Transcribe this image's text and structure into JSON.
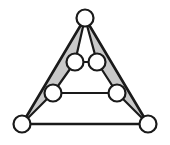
{
  "figure": {
    "type": "diagram",
    "background_color": "#ffffff",
    "width": 170,
    "height": 145
  },
  "style": {
    "edge_color": "#1a1a1a",
    "edge_width": 2.2,
    "outer_edge_width": 2.6,
    "node_fill": "#ffffff",
    "node_stroke": "#1a1a1a",
    "node_stroke_width": 2.2,
    "shade_fill": "#c9c9c9",
    "shade_stroke": "#1a1a1a"
  },
  "nodes": [
    {
      "id": "apex",
      "label": "",
      "cx": 85,
      "cy": 18,
      "r": 8.5
    },
    {
      "id": "upper-left",
      "label": "",
      "cx": 75,
      "cy": 62,
      "r": 8.5
    },
    {
      "id": "upper-right",
      "label": "",
      "cx": 97,
      "cy": 62,
      "r": 8.5
    },
    {
      "id": "mid-left",
      "label": "",
      "cx": 53,
      "cy": 93,
      "r": 8.5
    },
    {
      "id": "mid-right",
      "label": "",
      "cx": 117,
      "cy": 93,
      "r": 8.5
    },
    {
      "id": "bottom-left",
      "label": "",
      "cx": 22,
      "cy": 124,
      "r": 8.5
    },
    {
      "id": "bottom-right",
      "label": "",
      "cx": 148,
      "cy": 124,
      "r": 8.5
    }
  ],
  "edges": [
    {
      "id": "apex-to-bottom-left",
      "from": "apex",
      "to": "bottom-left",
      "kind": "outer"
    },
    {
      "id": "apex-to-bottom-right",
      "from": "apex",
      "to": "bottom-right",
      "kind": "outer"
    },
    {
      "id": "bottom-left-to-bottom-right",
      "from": "bottom-left",
      "to": "bottom-right",
      "kind": "outer"
    },
    {
      "id": "apex-to-upper-left",
      "from": "apex",
      "to": "upper-left",
      "kind": "inner"
    },
    {
      "id": "apex-to-upper-right",
      "from": "apex",
      "to": "upper-right",
      "kind": "inner"
    },
    {
      "id": "upper-left-to-upper-right",
      "from": "upper-left",
      "to": "upper-right",
      "kind": "inner"
    },
    {
      "id": "upper-left-to-mid-left",
      "from": "upper-left",
      "to": "mid-left",
      "kind": "inner"
    },
    {
      "id": "upper-right-to-mid-right",
      "from": "upper-right",
      "to": "mid-right",
      "kind": "inner"
    },
    {
      "id": "mid-left-to-mid-right",
      "from": "mid-left",
      "to": "mid-right",
      "kind": "inner"
    },
    {
      "id": "mid-left-to-bottom-left",
      "from": "mid-left",
      "to": "bottom-left",
      "kind": "inner"
    },
    {
      "id": "mid-right-to-bottom-right",
      "from": "mid-right",
      "to": "bottom-right",
      "kind": "inner"
    }
  ],
  "shaded_regions": [
    {
      "id": "left-shaded-region",
      "label": "",
      "vertex_ids": [
        "apex",
        "upper-left",
        "mid-left",
        "bottom-left"
      ],
      "points": "85,18 75,62 53,93 22,124"
    },
    {
      "id": "right-shaded-region",
      "label": "",
      "vertex_ids": [
        "apex",
        "upper-right",
        "mid-right",
        "bottom-right"
      ],
      "points": "85,18 97,62 117,93 148,124"
    }
  ]
}
